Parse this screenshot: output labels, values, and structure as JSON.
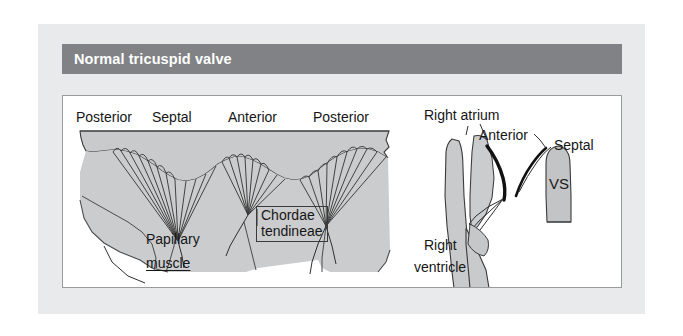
{
  "figure": {
    "kind": "anatomical-diagram",
    "header": {
      "title": "Normal tricuspid valve",
      "band_color": "#808285",
      "title_color": "#ffffff"
    },
    "palette": {
      "page_background": "#ffffff",
      "outer_panel": "#e9eaeb",
      "plate_background": "#ffffff",
      "plate_border": "#9a9b9d",
      "tissue_fill": "#c9cacb",
      "tissue_fill_dark": "#bdbec0",
      "outline": "#3a3a3a",
      "leaflet_dark": "#111111",
      "label_text": "#161616"
    },
    "left_panel": {
      "name": "unrolled-valve-view",
      "top_labels": [
        {
          "text": "Posterior"
        },
        {
          "text": "Septal"
        },
        {
          "text": "Anterior"
        },
        {
          "text": "Posterior"
        }
      ],
      "papillary_label": {
        "line_1": "Papillary",
        "line_2": "muscle"
      },
      "chordae_label": {
        "line_1": "Chordae",
        "line_2": "tendineae",
        "boxed": true
      }
    },
    "right_panel": {
      "name": "cross-section-view",
      "labels": [
        {
          "text": "Right atrium"
        },
        {
          "text": "Anterior"
        },
        {
          "text": "Septal"
        },
        {
          "text": "VS"
        }
      ],
      "ventricle_label": {
        "line_1": "Right",
        "line_2": "ventricle"
      }
    }
  }
}
